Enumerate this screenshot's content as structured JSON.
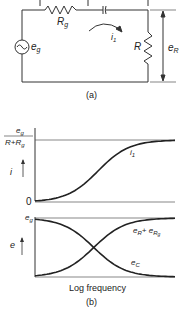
{
  "circuit": {
    "source_label": "e",
    "source_sub": "g",
    "rg_label": "R",
    "rg_sub": "g",
    "current_label": "i",
    "current_sub": "1",
    "r_label": "R",
    "er_label": "e",
    "er_sub": "R",
    "caption": "(a)"
  },
  "chart_data": [
    {
      "type": "line",
      "title": "",
      "ylabel": "i",
      "xlabel": "",
      "y_top_label_num": "e",
      "y_top_label_num_sub": "g",
      "y_top_label_den": "R+R",
      "y_top_label_den_sub": "g",
      "y_zero_label": "0",
      "series": [
        {
          "name": "i1",
          "label": "i",
          "label_sub": "1",
          "shape": "sigmoid-rising",
          "start": 0,
          "end": 1
        }
      ]
    },
    {
      "type": "line",
      "title": "",
      "ylabel": "e",
      "xlabel": "Log frequency",
      "y_top_label": "e",
      "y_top_label_sub": "g",
      "series": [
        {
          "name": "eR+eRg",
          "label": "e",
          "label_sub": "R",
          "label_plus": "+ e",
          "label_sub2": "R",
          "label_sub3": "g",
          "shape": "sigmoid-rising",
          "start": 0,
          "end": 1
        },
        {
          "name": "eC",
          "label": "e",
          "label_sub": "C",
          "shape": "sigmoid-falling",
          "start": 1,
          "end": 0
        }
      ],
      "caption": "(b)"
    }
  ]
}
